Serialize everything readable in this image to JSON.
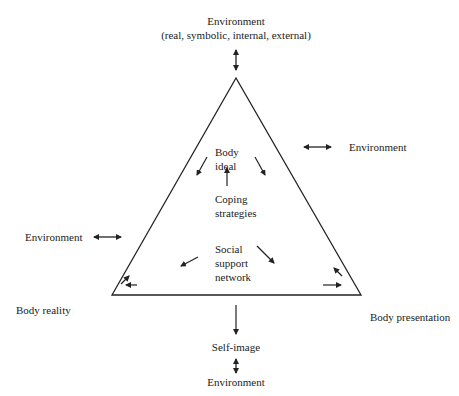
{
  "diagram": {
    "type": "triangle-model",
    "top_label": {
      "line1": "Environment",
      "line2": "(real, symbolic, internal, external)"
    },
    "right_environment": "Environment",
    "left_environment": "Environment",
    "center_top": {
      "line1": "Body",
      "line2": "ideal"
    },
    "center_middle": {
      "line1": "Coping",
      "line2": "strategies"
    },
    "center_bottom": {
      "line1": "Social",
      "line2": "support",
      "line3": "network"
    },
    "corner_left": "Body reality",
    "corner_right": "Body presentation",
    "bottom_node": "Self-image",
    "bottom_environment": "Environment",
    "colors": {
      "line": "#222222",
      "text": "#222222",
      "background": "#ffffff"
    }
  }
}
